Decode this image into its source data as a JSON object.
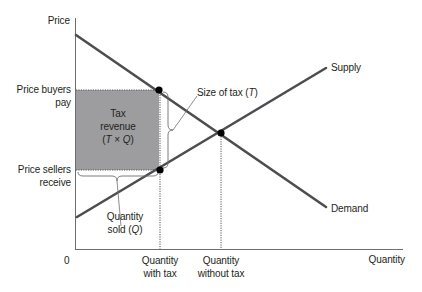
{
  "diagram": {
    "type": "supply-demand-tax",
    "axes": {
      "y_label": "Price",
      "x_label": "Quantity",
      "origin_label": "0"
    },
    "price_labels": {
      "buyers_line1": "Price buyers",
      "buyers_line2": "pay",
      "sellers_line1": "Price sellers",
      "sellers_line2": "receive"
    },
    "quantity_labels": {
      "with_tax_line1": "Quantity",
      "with_tax_line2": "with tax",
      "without_tax_line1": "Quantity",
      "without_tax_line2": "without tax"
    },
    "curves": {
      "supply": "Supply",
      "demand": "Demand"
    },
    "annotations": {
      "tax_revenue_line1": "Tax",
      "tax_revenue_line2": "revenue",
      "tax_revenue_line3_prefix": "(",
      "tax_revenue_T": "T",
      "tax_revenue_times": " × ",
      "tax_revenue_Q": "Q",
      "tax_revenue_line3_suffix": ")",
      "size_of_tax_prefix": "Size of tax (",
      "size_of_tax_T": "T",
      "size_of_tax_suffix": ")",
      "quantity_sold_line1": "Quantity",
      "quantity_sold_prefix": "sold (",
      "quantity_sold_Q": "Q",
      "quantity_sold_suffix": ")"
    },
    "colors": {
      "curve": "#4d4d4f",
      "axis": "#6d6e70",
      "tax_area": "#9d9d9f",
      "text": "#231f20",
      "point": "#000000"
    }
  }
}
